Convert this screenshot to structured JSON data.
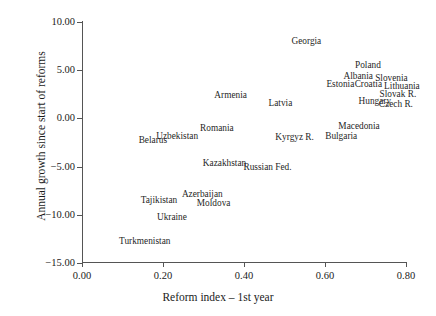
{
  "chart_data": {
    "type": "scatter",
    "title": "",
    "xlabel": "Reform index – 1st year",
    "ylabel": "Annual growth since start of reforms",
    "xlim": [
      -0.02,
      0.86
    ],
    "ylim": [
      -15.6,
      10.4
    ],
    "xticks": [
      "0.00",
      "0.20",
      "0.40",
      "0.60",
      "0.80"
    ],
    "xtick_values": [
      0.0,
      0.2,
      0.4,
      0.6,
      0.8
    ],
    "yticks": [
      "10.00",
      "5.00",
      "0.00",
      "−5.00",
      "−10.00",
      "−15.00"
    ],
    "ytick_values": [
      10,
      5,
      0,
      -5,
      -10,
      -15
    ],
    "grid": false,
    "legend": null,
    "marker_style": "text-labels-only",
    "points": [
      {
        "label": "Georgia",
        "x": 0.554,
        "y": 8.0
      },
      {
        "label": "Poland",
        "x": 0.706,
        "y": 5.5
      },
      {
        "label": "Albania",
        "x": 0.682,
        "y": 4.4
      },
      {
        "label": "Slovenia",
        "x": 0.764,
        "y": 4.2
      },
      {
        "label": "Estonia",
        "x": 0.638,
        "y": 3.5
      },
      {
        "label": "Croatia",
        "x": 0.707,
        "y": 3.5
      },
      {
        "label": "Lithuania",
        "x": 0.79,
        "y": 3.3
      },
      {
        "label": "Slovak R.",
        "x": 0.78,
        "y": 2.5
      },
      {
        "label": "Hungary",
        "x": 0.723,
        "y": 1.8
      },
      {
        "label": "Czech R.",
        "x": 0.775,
        "y": 1.5
      },
      {
        "label": "Armenia",
        "x": 0.367,
        "y": 2.4
      },
      {
        "label": "Latvia",
        "x": 0.49,
        "y": 1.6
      },
      {
        "label": "Macedonia",
        "x": 0.684,
        "y": -0.8
      },
      {
        "label": "Romania",
        "x": 0.333,
        "y": -1.0
      },
      {
        "label": "Uzbekistan",
        "x": 0.235,
        "y": -1.8
      },
      {
        "label": "Bulgaria",
        "x": 0.64,
        "y": -1.8
      },
      {
        "label": "Kyrgyz R.",
        "x": 0.525,
        "y": -1.9
      },
      {
        "label": "Belarus",
        "x": 0.175,
        "y": -2.2
      },
      {
        "label": "Kazakhstan",
        "x": 0.352,
        "y": -4.6
      },
      {
        "label": "Russian Fed.",
        "x": 0.458,
        "y": -5.0
      },
      {
        "label": "Azerbaijan",
        "x": 0.297,
        "y": -7.8
      },
      {
        "label": "Tajikistan",
        "x": 0.19,
        "y": -8.5
      },
      {
        "label": "Moldova",
        "x": 0.325,
        "y": -8.8
      },
      {
        "label": "Ukraine",
        "x": 0.222,
        "y": -10.2
      },
      {
        "label": "Turkmenistan",
        "x": 0.155,
        "y": -12.7
      }
    ]
  },
  "style": {
    "axis_color": "#555555",
    "text_color": "#1a1a1a",
    "background": "#ffffff"
  }
}
